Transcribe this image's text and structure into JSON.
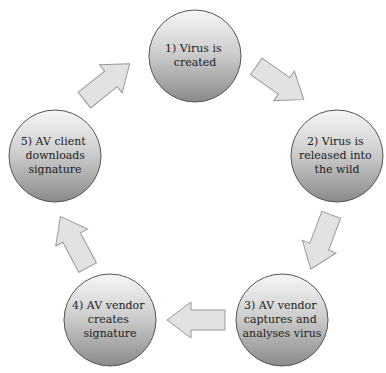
{
  "diagram": {
    "type": "cycle",
    "colors": {
      "node_fill_top": "#f4f4f4",
      "node_fill_bottom": "#8e8e8e",
      "node_stroke": "#555555",
      "arrow_fill": "#e2e2e2",
      "arrow_stroke": "#9a9a9a",
      "text": "#222222"
    },
    "nodes": [
      {
        "id": "1",
        "lines": [
          "1) Virus is",
          "created"
        ]
      },
      {
        "id": "2",
        "lines": [
          "2) Virus is",
          "released into",
          "the wild"
        ]
      },
      {
        "id": "3",
        "lines": [
          "3) AV vendor",
          "captures and",
          "analyses virus"
        ]
      },
      {
        "id": "4",
        "lines": [
          "4) AV vendor",
          "creates",
          "signature"
        ]
      },
      {
        "id": "5",
        "lines": [
          "5) AV client",
          "downloads",
          "signature"
        ]
      }
    ],
    "edges": [
      {
        "from": "1",
        "to": "2"
      },
      {
        "from": "2",
        "to": "3"
      },
      {
        "from": "3",
        "to": "4"
      },
      {
        "from": "4",
        "to": "5"
      },
      {
        "from": "5",
        "to": "1"
      }
    ]
  }
}
